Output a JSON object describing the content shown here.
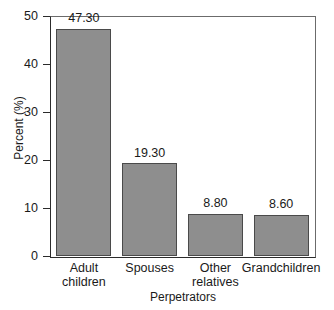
{
  "chart_data": {
    "type": "bar",
    "title": "",
    "xlabel": "Perpetrators",
    "ylabel": "Percent (%)",
    "categories": [
      "Adult children",
      "Spouses",
      "Other relatives",
      "Grandchildren"
    ],
    "category_lines": [
      [
        "Adult",
        "children"
      ],
      [
        "Spouses"
      ],
      [
        "Other",
        "relatives"
      ],
      [
        "Grandchildren"
      ]
    ],
    "values": [
      47.3,
      19.3,
      8.8,
      8.6
    ],
    "value_labels": [
      "47.30",
      "19.30",
      "8.80",
      "8.60"
    ],
    "ylim": [
      0,
      50
    ],
    "yticks": [
      0,
      10,
      20,
      30,
      40,
      50
    ],
    "ytick_labels": [
      "0",
      "10",
      "20",
      "30",
      "40",
      "50"
    ],
    "grid": false,
    "legend": "none",
    "bar_color": "#8e8e8e",
    "bar_border_color": "#4a4a4a",
    "axis_color": "#2b2b2b",
    "frame_color": "#6b6b6b"
  }
}
